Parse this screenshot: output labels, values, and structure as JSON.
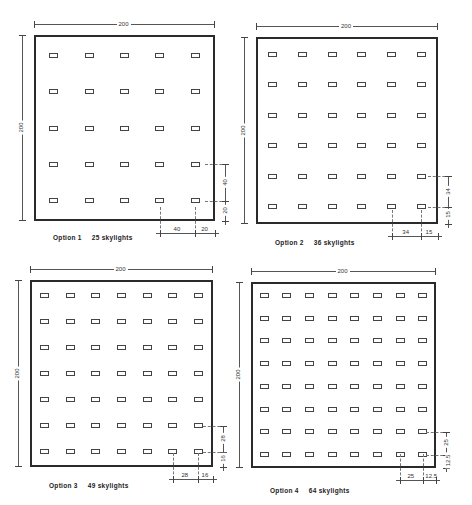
{
  "options": [
    {
      "id": 1,
      "label": "Option 1",
      "count_label": "25 skylights",
      "grid": 5,
      "width_label": "200",
      "height_label": "200",
      "spacing_label": "40",
      "edge_label": "20",
      "box": {
        "x": 34,
        "y": 35,
        "w": 181,
        "h": 186
      },
      "caption": {
        "x": 53,
        "y": 234
      }
    },
    {
      "id": 2,
      "label": "Option 2",
      "count_label": "36 skylights",
      "grid": 6,
      "width_label": "200",
      "height_label": "200",
      "spacing_label": "34",
      "edge_label": "15",
      "box": {
        "x": 256,
        "y": 37,
        "w": 182,
        "h": 187
      },
      "caption": {
        "x": 275,
        "y": 239
      }
    },
    {
      "id": 3,
      "label": "Option 3",
      "count_label": "49 skylights",
      "grid": 7,
      "width_label": "200",
      "height_label": "200",
      "spacing_label": "28",
      "edge_label": "16",
      "box": {
        "x": 30,
        "y": 280,
        "w": 183,
        "h": 187
      },
      "caption": {
        "x": 49,
        "y": 482
      }
    },
    {
      "id": 4,
      "label": "Option 4",
      "count_label": "64 skylights",
      "grid": 8,
      "width_label": "200",
      "height_label": "200",
      "spacing_label": "25",
      "edge_label": "12.5",
      "box": {
        "x": 251,
        "y": 282,
        "w": 185,
        "h": 186
      },
      "caption": {
        "x": 270,
        "y": 487
      }
    }
  ]
}
